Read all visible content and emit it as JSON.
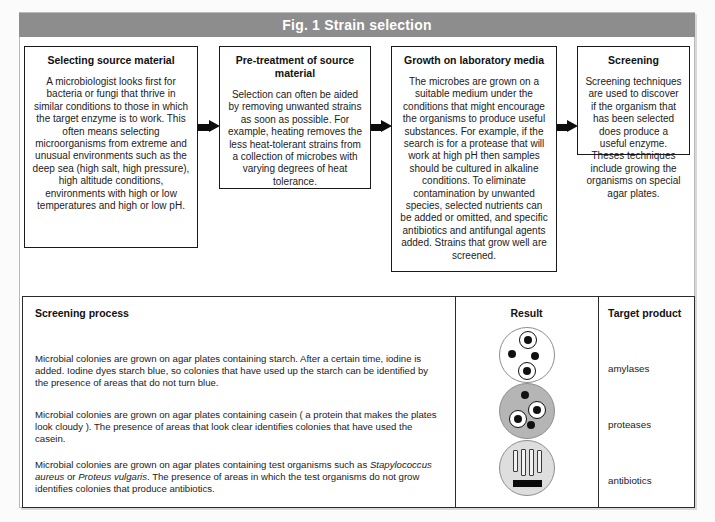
{
  "figure": {
    "scan_artifact": "",
    "header_title": "Fig. 1  Strain selection",
    "header_bg": "#8d8d8d",
    "header_text_color": "#ffffff"
  },
  "flow": {
    "steps": [
      {
        "title": "Selecting source material",
        "body": "A microbiologist looks first for bacteria or fungi that thrive in similar conditions to those in which the target enzyme is to work. This often means selecting microorganisms from extreme and unusual environments such as the deep sea (high salt, high pressure), high altitude conditions, environments with high or low temperatures and high or low pH."
      },
      {
        "title": "Pre-treatment of source material",
        "body": "Selection can often be aided by removing unwanted strains as soon as possible. For example, heating removes the less heat-tolerant strains from a collection of microbes with varying degrees of heat tolerance."
      },
      {
        "title": "Growth on laboratory media",
        "body": "The microbes are grown on a suitable medium under the conditions that might encourage the organisms to produce useful substances. For example, if the search is for a protease that will work at high pH then samples should be cultured in alkaline conditions. To eliminate contamination by unwanted species, selected nutrients can be added or omitted, and specific antibiotics and antifungal agents added. Strains that grow well are screened."
      },
      {
        "title": "Screening",
        "body": "Screening techniques are used to discover if the organism that has been selected does produce a useful enzyme. Theses techniques include growing the organisms on special agar plates."
      }
    ],
    "connectors": [
      "arrow-right",
      "arrow-right",
      "arrow-right"
    ]
  },
  "table": {
    "headers": {
      "process": "Screening process",
      "result": "Result",
      "target": "Target product"
    },
    "rows": [
      {
        "process_html": "Microbial colonies are grown on agar plates containing starch. After a certain time, iodine is added. Iodine dyes starch blue, so colonies that have used up the starch can be identified by the presence of areas that do not turn blue.",
        "target": "amylases",
        "result_plate": "clear-agar-plate-with-four-colonies-two-haloed"
      },
      {
        "process_html": "Microbial colonies are grown on agar plates containing casein ( a protein that makes the plates look cloudy ). The presence of areas that look clear identifies colonies that  have used the casein.",
        "target": "proteases",
        "result_plate": "cloudy-agar-plate-with-four-colonies-two-haloed"
      },
      {
        "process_html": "Microbial colonies are grown on agar plates containing test organisms such as <i>Stapylococcus aureus</i> or <i>Proteus vulgaris</i>. The presence of areas in which the test organisms do not grow identifies colonies that produce antibiotics.",
        "target": "antibiotics",
        "result_plate": "lawn-agar-plate-with-four-streaks-and-inhibition-zone"
      }
    ]
  }
}
